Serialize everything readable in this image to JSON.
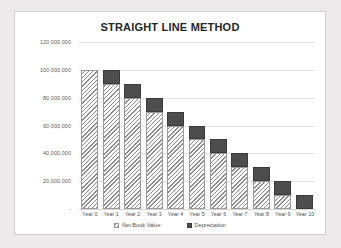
{
  "chart_data": {
    "type": "bar",
    "subtype": "stacked-column",
    "title": "STRAIGHT LINE METHOD",
    "xlabel": "",
    "ylabel": "",
    "categories": [
      "Year 0",
      "Year 1",
      "Year 2",
      "Year 3",
      "Year 4",
      "Year 5",
      "Year 6",
      "Year 7",
      "Year 8",
      "Year 9",
      "Year 10"
    ],
    "series": [
      {
        "name": "Net Book Value",
        "values": [
          100000000,
          90000000,
          80000000,
          70000000,
          60000000,
          50000000,
          40000000,
          30000000,
          20000000,
          10000000,
          0
        ]
      },
      {
        "name": "Depreciation",
        "values": [
          0,
          10000000,
          10000000,
          10000000,
          10000000,
          10000000,
          10000000,
          10000000,
          10000000,
          10000000,
          10000000
        ]
      }
    ],
    "ylim": [
      0,
      120000000
    ],
    "ytick_values": [
      0,
      20000000,
      40000000,
      60000000,
      80000000,
      100000000,
      120000000
    ],
    "ytick_labels": [
      "-",
      "20,000,000",
      "40,000,000",
      "60,000,000",
      "80,000,000",
      "100,000,000",
      "120,000,000"
    ],
    "grid": true,
    "legend_position": "bottom",
    "colors": {
      "net_book_value": "#fafafa",
      "net_book_value_hatch": "#8d8d8d",
      "depreciation": "#4d4d4d",
      "gridline": "#e2e2e2",
      "title_text": "#262626",
      "axis_text": "#5b5b5b",
      "frame_border": "#cfcfcf",
      "page_background": "#eceaea",
      "plot_background": "#ffffff"
    }
  },
  "legend": {
    "items": [
      {
        "label": "Net Book Value",
        "swatch": "hatched-square-icon"
      },
      {
        "label": "Depreciation",
        "swatch": "filled-square-icon"
      }
    ]
  }
}
